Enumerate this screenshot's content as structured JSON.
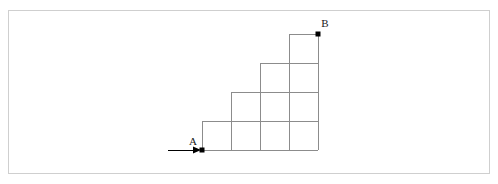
{
  "figure": {
    "background_color": "#ffffff",
    "border_color": "#cfcfcf",
    "grid_line_color": "#8c8c8c",
    "marker_color": "#000000",
    "label_color": "#1a1a1a"
  },
  "geometry": {
    "cell_size": 29,
    "x_lines": [
      202,
      231,
      260,
      289,
      318
    ],
    "y_lines": [
      34,
      63,
      92,
      121,
      150
    ],
    "column_heights": [
      1,
      2,
      3,
      4
    ],
    "baseline_y": 150
  },
  "points": {
    "a": {
      "label": "A",
      "x": 202,
      "y": 150,
      "label_x": 193,
      "label_y": 145
    },
    "b": {
      "label": "B",
      "x": 318,
      "y": 34,
      "label_x": 325,
      "label_y": 27
    }
  },
  "arrow": {
    "name": "entry-arrow",
    "start_x": 168,
    "end_x": 202,
    "y": 150
  }
}
